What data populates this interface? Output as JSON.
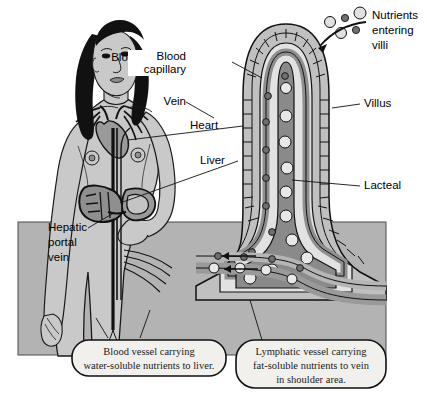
{
  "diagram": {
    "background_color": "#ffffff",
    "band_color": "#b0b0b0",
    "skin_color": "#c9c9c9",
    "hair_color": "#111111",
    "vessel_dark": "#8a8a8a",
    "vessel_mid": "#a8a8a8",
    "vessel_light": "#d8d8d8",
    "outline_color": "#000000"
  },
  "labels": {
    "blood_capillary": "Blood capillary",
    "vein": "Vein",
    "heart": "Heart",
    "liver": "Liver",
    "hepatic_portal_vein": "Hepatic portal vein",
    "hepatic_portal_vein_lines": [
      "Hepatic",
      "portal",
      "vein"
    ],
    "nutrients_entering_villi": "Nutrients entering villi",
    "nutrients_entering_villi_lines": [
      "Nutrients",
      "entering",
      "villi"
    ],
    "villus": "Villus",
    "lacteal": "Lacteal"
  },
  "captions": {
    "blood_vessel": {
      "text": "Blood vessel carrying water-soluble nutrients to liver.",
      "lines": [
        "Blood vessel carrying",
        "water-soluble nutrients to liver."
      ]
    },
    "lymphatic_vessel": {
      "text": "Lymphatic vessel carrying fat-soluble nutrients to vein in shoulder area.",
      "lines": [
        "Lymphatic vessel carrying",
        "fat-soluble nutrients to vein",
        "in shoulder area."
      ]
    }
  },
  "particles": {
    "fat_soluble_legend": "light circle = fat-soluble nutrient",
    "water_soluble_legend": "dark dot = water-soluble nutrient"
  }
}
